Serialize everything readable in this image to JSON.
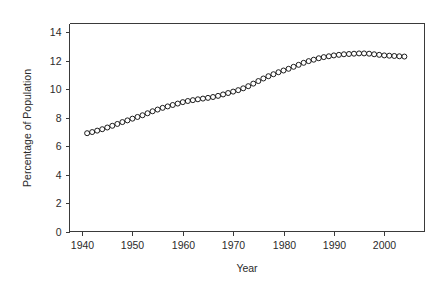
{
  "chart_data": {
    "type": "scatter",
    "title": "",
    "subtitle": "",
    "xlabel": "Year",
    "ylabel": "Percentage of Population",
    "xlim": [
      1937.5,
      2008
    ],
    "ylim": [
      0,
      14.6
    ],
    "xticks": [
      1940,
      1950,
      1960,
      1970,
      1980,
      1990,
      2000
    ],
    "xtick_labels": [
      "1940",
      "1950",
      "1960",
      "1970",
      "1980",
      "1990",
      "2000"
    ],
    "yticks": [
      0,
      2,
      4,
      6,
      8,
      10,
      12,
      14
    ],
    "ytick_labels": [
      "0",
      "2",
      "4",
      "6",
      "8",
      "10",
      "12",
      "14"
    ],
    "grid": false,
    "legend": false,
    "legend_position": "none",
    "marker": "open-circle",
    "marker_color": "#1c1c1c",
    "series": [
      {
        "name": "Percentage of Population",
        "x": [
          1941,
          1942,
          1943,
          1944,
          1945,
          1946,
          1947,
          1948,
          1949,
          1950,
          1951,
          1952,
          1953,
          1954,
          1955,
          1956,
          1957,
          1958,
          1959,
          1960,
          1961,
          1962,
          1963,
          1964,
          1965,
          1966,
          1967,
          1968,
          1969,
          1970,
          1971,
          1972,
          1973,
          1974,
          1975,
          1976,
          1977,
          1978,
          1979,
          1980,
          1981,
          1982,
          1983,
          1984,
          1985,
          1986,
          1987,
          1988,
          1989,
          1990,
          1991,
          1992,
          1993,
          1994,
          1995,
          1996,
          1997,
          1998,
          1999,
          2000,
          2001,
          2002,
          2003,
          2004
        ],
        "y": [
          6.9,
          6.98,
          7.08,
          7.18,
          7.3,
          7.42,
          7.55,
          7.68,
          7.8,
          7.92,
          8.04,
          8.16,
          8.3,
          8.44,
          8.56,
          8.68,
          8.78,
          8.88,
          8.98,
          9.08,
          9.16,
          9.22,
          9.28,
          9.33,
          9.38,
          9.44,
          9.52,
          9.62,
          9.72,
          9.82,
          9.92,
          10.05,
          10.2,
          10.38,
          10.56,
          10.74,
          10.9,
          11.04,
          11.18,
          11.3,
          11.42,
          11.56,
          11.7,
          11.84,
          11.96,
          12.06,
          12.16,
          12.24,
          12.3,
          12.36,
          12.4,
          12.44,
          12.46,
          12.48,
          12.5,
          12.5,
          12.48,
          12.44,
          12.4,
          12.36,
          12.34,
          12.32,
          12.3,
          12.28
        ]
      }
    ]
  },
  "labels": {
    "xaxis_title": "Year",
    "yaxis_title": "Percentage of Population"
  }
}
